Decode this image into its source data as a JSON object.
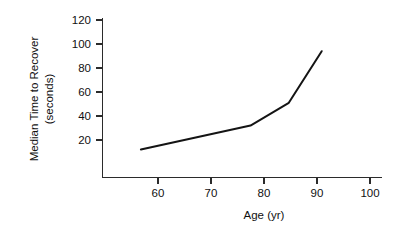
{
  "chart_data": {
    "type": "line",
    "title": "",
    "xlabel": "Age (yr)",
    "ylabel": "Median Time to Recover (seconds)",
    "ylabel_line1": "Median Time to Recover",
    "ylabel_line2": "(seconds)",
    "xlim": [
      53,
      104
    ],
    "ylim": [
      0,
      124
    ],
    "xticks": [
      60,
      70,
      80,
      90,
      100
    ],
    "xtick_labels": [
      "60",
      "70",
      "80",
      "90",
      "100"
    ],
    "yticks": [
      20,
      40,
      60,
      80,
      100,
      120
    ],
    "ytick_labels": [
      "20",
      "40",
      "60",
      "80",
      "100",
      "120"
    ],
    "grid": false,
    "legend": "none",
    "series": [
      {
        "name": "Median time to recover",
        "x": [
          60,
          70,
          80,
          87,
          93
        ],
        "values": [
          12,
          22,
          32,
          51,
          94
        ]
      }
    ],
    "line_color": "#141414",
    "axis_color": "#2b2b2b"
  }
}
